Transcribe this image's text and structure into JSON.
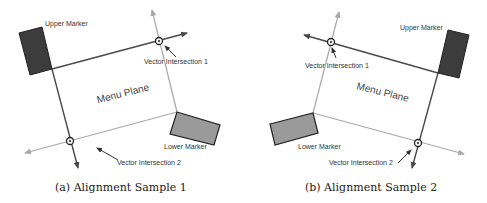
{
  "colors": {
    "dark_line": "#4a4a4a",
    "light_line": "#a8a8a8",
    "upper_marker_fill": "#3c3c3c",
    "lower_marker_fill": "#9a9a9a",
    "marker_stroke": "#222222"
  },
  "panels": [
    {
      "caption": "(a) Alignment Sample 1",
      "labels": {
        "upper_marker": "Upper Marker",
        "lower_marker": "Lower Marker",
        "menu_plane": "Menu Plane",
        "intersection_1": "Vector Intersection 1",
        "intersection_2": "Vector Intersection 2"
      }
    },
    {
      "caption": "(b) Alignment Sample 2",
      "labels": {
        "upper_marker": "Upper Marker",
        "lower_marker": "Lower Marker",
        "menu_plane": "Menu Plane",
        "intersection_1": "Vector Intersection 1",
        "intersection_2": "Vector Intersection 2"
      }
    }
  ]
}
